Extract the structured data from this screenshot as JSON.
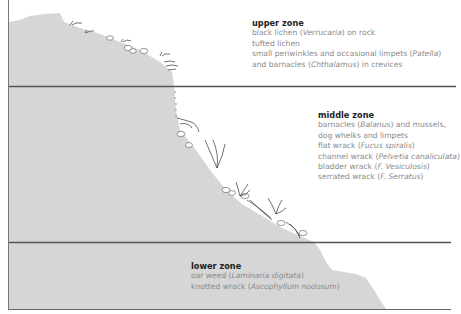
{
  "zones": [
    {
      "id": "upper",
      "title": "upper zone",
      "lines": [
        [
          "black lichen (",
          {
            "i": "Verrucaria"
          },
          ") on rock"
        ],
        [
          "tufted lichen"
        ],
        [
          "small periwinkles and occasional limpets (",
          {
            "i": "Patella"
          },
          ")"
        ],
        [
          "and barnacles (",
          {
            "i": "Chthalamus"
          },
          ") in crevices"
        ]
      ]
    },
    {
      "id": "middle",
      "title": "middle zone",
      "lines": [
        [
          "barnacles (",
          {
            "i": "Balanus"
          },
          ") and mussels,"
        ],
        [
          "dog whelks and limpets"
        ],
        [
          "flat wrack (",
          {
            "i": "Fucus spiralis"
          },
          ")"
        ],
        [
          "channel wrack (",
          {
            "i": "Pelvetia canaliculata"
          },
          ")"
        ],
        [
          "bladder wrack  (",
          {
            "i": "F. Vesiculosis"
          },
          ")"
        ],
        [
          "serrated wrack (",
          {
            "i": "F. Serratus"
          },
          ")"
        ]
      ]
    },
    {
      "id": "lower",
      "title": "lower zone",
      "lines": [
        [
          "oar weed (",
          {
            "i": "Laminaria digitata"
          },
          ")"
        ],
        [
          "knotted wrack (",
          {
            "i": "Ascophyllum nodosum"
          },
          ")"
        ]
      ]
    }
  ],
  "colors": {
    "rock": "#d6d6d6",
    "divider": "#555555",
    "title": "#222222",
    "body_text": "#8a8a8a"
  }
}
